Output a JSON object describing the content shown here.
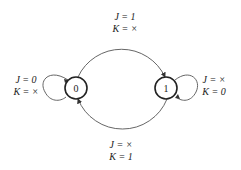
{
  "diagram": {
    "type": "state-diagram",
    "states": [
      {
        "id": "0",
        "label": "0"
      },
      {
        "id": "1",
        "label": "1"
      }
    ],
    "transitions": [
      {
        "from": "0",
        "to": "0",
        "J": "0",
        "K": "×",
        "label_j": "J = 0",
        "label_k": "K = ×"
      },
      {
        "from": "0",
        "to": "1",
        "J": "1",
        "K": "×",
        "label_j": "J = 1",
        "label_k": "K = ×"
      },
      {
        "from": "1",
        "to": "1",
        "J": "×",
        "K": "0",
        "label_j": "J = ×",
        "label_k": "K = 0"
      },
      {
        "from": "1",
        "to": "0",
        "J": "×",
        "K": "1",
        "label_j": "J = ×",
        "label_k": "K = 1"
      }
    ]
  },
  "colors": {
    "stroke": "#333333",
    "text": "#222222",
    "background": "#ffffff"
  }
}
